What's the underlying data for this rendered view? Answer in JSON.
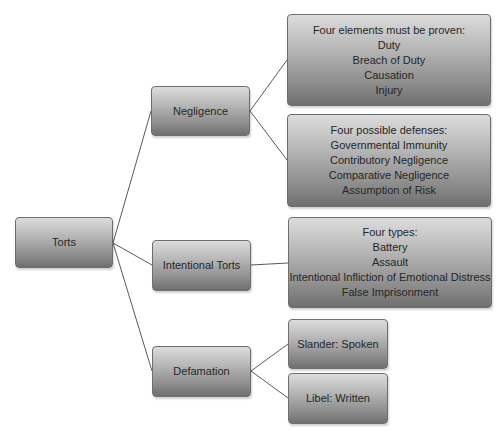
{
  "diagram": {
    "type": "tree",
    "style": {
      "node_gradient_top": "#dcdcdc",
      "node_gradient_bottom": "#6f6f6f",
      "node_border": "#6e6e6e",
      "text_color": "#262626",
      "connector_color": "#5a5a5a"
    },
    "root": {
      "label": "Torts"
    },
    "branches": {
      "negligence": {
        "label": "Negligence",
        "elements": {
          "heading": "Four elements must be proven:",
          "items": [
            "Duty",
            "Breach of Duty",
            "Causation",
            "Injury"
          ]
        },
        "defenses": {
          "heading": "Four possible defenses:",
          "items": [
            "Governmental Immunity",
            "Contributory Negligence",
            "Comparative Negligence",
            "Assumption of Risk"
          ]
        }
      },
      "intentional": {
        "label": "Intentional Torts",
        "types": {
          "heading": "Four types:",
          "items": [
            "Battery",
            "Assault",
            "Intentional Infliction of Emotional Distress",
            "False Imprisonment"
          ]
        }
      },
      "defamation": {
        "label": "Defamation",
        "slander": "Slander: Spoken",
        "libel": "Libel: Written"
      }
    }
  }
}
